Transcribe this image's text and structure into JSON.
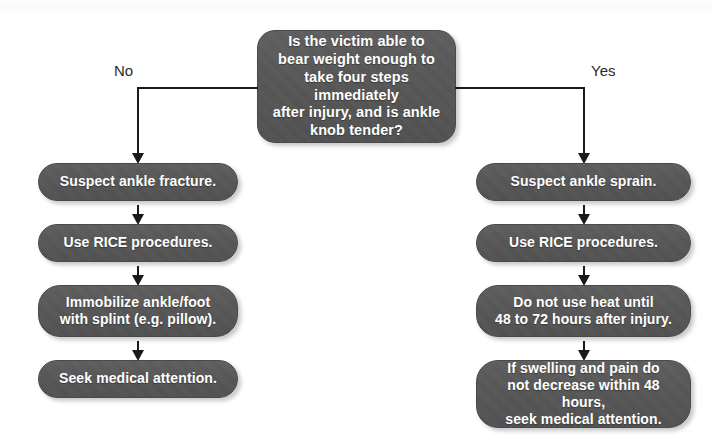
{
  "diagram": {
    "colors": {
      "node_fill": "#575757",
      "node_text": "#ffffff",
      "connector": "#1a1a1a",
      "label_text": "#2b2b2b",
      "background": "#ffffff"
    },
    "decision": {
      "id": "decision-ankle-assessment",
      "text": "Is the victim able to\nbear weight enough to\ntake four steps immediately\nafter injury, and is ankle\nknob tender?"
    },
    "branches": [
      {
        "label": "No",
        "side": "left",
        "steps": [
          {
            "id": "suspect-ankle-fracture",
            "text": "Suspect ankle fracture."
          },
          {
            "id": "use-rice-procedures-left",
            "text": "Use RICE procedures."
          },
          {
            "id": "immobilize-ankle-foot",
            "text": "Immobilize ankle/foot\nwith splint (e.g. pillow)."
          },
          {
            "id": "seek-medical-attention",
            "text": "Seek medical attention."
          }
        ]
      },
      {
        "label": "Yes",
        "side": "right",
        "steps": [
          {
            "id": "suspect-ankle-sprain",
            "text": "Suspect ankle sprain."
          },
          {
            "id": "use-rice-procedures-right",
            "text": "Use RICE procedures."
          },
          {
            "id": "do-not-use-heat",
            "text": "Do not use heat until\n48 to 72 hours after injury."
          },
          {
            "id": "if-swelling-and-pain",
            "text": "If swelling and pain do\nnot decrease within 48 hours,\nseek medical attention."
          }
        ]
      }
    ]
  }
}
